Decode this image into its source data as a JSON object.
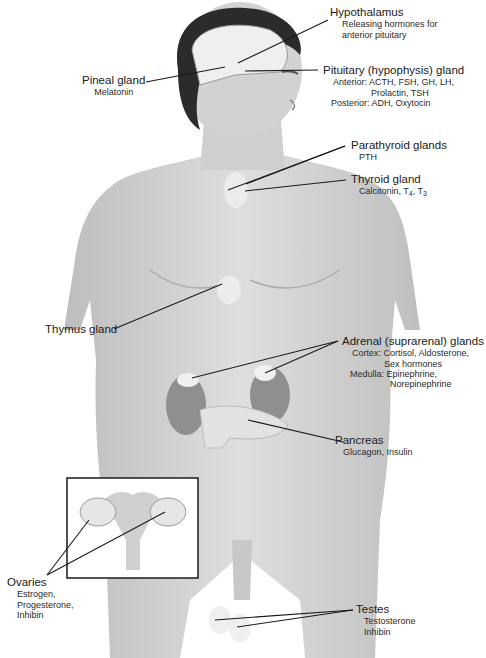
{
  "figure": {
    "colors": {
      "skin": "#d9d9d9",
      "skin_shadow": "#bdbdbd",
      "hair": "#2b2b2b",
      "leader_line": "#1a1a1a",
      "gland": "#ededed",
      "inset_border": "#1a1a1a"
    }
  },
  "labels": {
    "hypothalamus": {
      "name": "Hypothalamus",
      "line1": "Releasing hormones for",
      "line2": "anterior pituitary"
    },
    "pineal": {
      "name": "Pineal gland",
      "line1": "Melatonin"
    },
    "pituitary": {
      "name": "Pituitary (hypophysis) gland",
      "line1": "Anterior: ACTH, FSH, GH, LH,",
      "line2": "Prolactin, TSH",
      "line3": "Posterior: ADH, Oxytocin"
    },
    "parathyroid": {
      "name": "Parathyroid glands",
      "line1": "PTH"
    },
    "thyroid": {
      "name": "Thyroid gland",
      "line1_prefix": "Calcitonin, T",
      "t4_sub": "4",
      "mid": ", T",
      "t3_sub": "3"
    },
    "thymus": {
      "name": "Thymus gland"
    },
    "adrenal": {
      "name": "Adrenal (suprarenal) glands",
      "line1": "Cortex: Cortisol, Aldosterone,",
      "line2": "Sex hormones",
      "line3": "Medulla: Epinephrine,",
      "line4": "Norepinephrine"
    },
    "pancreas": {
      "name": "Pancreas",
      "line1": "Glucagon, Insulin"
    },
    "ovaries": {
      "name": "Ovaries",
      "line1": "Estrogen,",
      "line2": "Progesterone,",
      "line3": "Inhibin"
    },
    "testes": {
      "name": "Testes",
      "line1": "Testosterone",
      "line2": "Inhibin"
    }
  }
}
